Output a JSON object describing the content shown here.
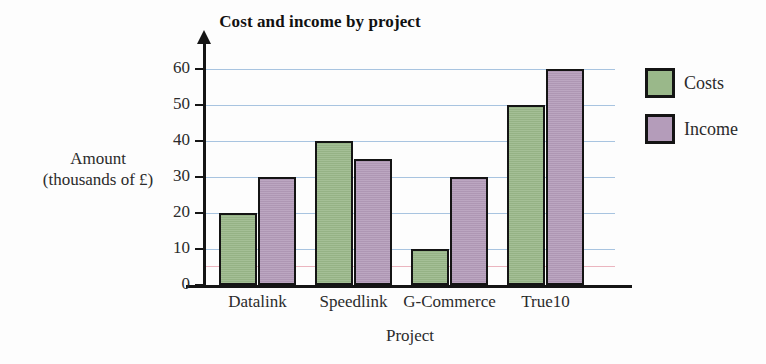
{
  "chart_data": {
    "type": "bar",
    "title": "Cost and income by project",
    "xlabel": "Project",
    "ylabel_line1": "Amount",
    "ylabel_line2": "(thousands of £)",
    "categories": [
      "Datalink",
      "Speedlink",
      "G-Commerce",
      "True10"
    ],
    "series": [
      {
        "name": "Costs",
        "color": "#9ab88a",
        "values": [
          20,
          40,
          10,
          50
        ]
      },
      {
        "name": "Income",
        "color": "#b49cba",
        "values": [
          30,
          35,
          30,
          60
        ]
      }
    ],
    "ylim": [
      0,
      60
    ],
    "yticks": [
      0,
      10,
      20,
      30,
      40,
      50,
      60
    ],
    "ytick_labels": [
      "0",
      "10",
      "20",
      "30",
      "40",
      "50",
      "60"
    ],
    "grid": true,
    "grid_color": "#a8c4e0",
    "legend_position": "right",
    "bar_border_color": "#141414"
  },
  "legend": {
    "entries": [
      {
        "label": "Costs"
      },
      {
        "label": "Income"
      }
    ]
  }
}
